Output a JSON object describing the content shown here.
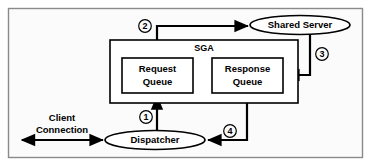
{
  "diagram": {
    "background_color": "#ffffff",
    "frame_color": "#8a8a8a",
    "line_color": "#000000",
    "shape_fill": "#ffffff",
    "nodes": {
      "shared_server": {
        "label": "Shared Server",
        "shape": "ellipse"
      },
      "dispatcher": {
        "label": "Dispatcher",
        "shape": "ellipse"
      },
      "sga": {
        "label": "SGA",
        "shape": "rectangle"
      },
      "request_queue": {
        "label_line1": "Request",
        "label_line2": "Queue",
        "shape": "rectangle"
      },
      "response_queue": {
        "label_line1": "Response",
        "label_line2": "Queue",
        "shape": "rectangle"
      },
      "client_connection": {
        "label_line1": "Client",
        "label_line2": "Connection",
        "shape": "text"
      }
    },
    "step_markers": [
      {
        "id": "step-1",
        "number": "1",
        "description": "Dispatcher to Request Queue"
      },
      {
        "id": "step-2",
        "number": "2",
        "description": "Request Queue to Shared Server"
      },
      {
        "id": "step-3",
        "number": "3",
        "description": "Shared Server to Response Queue"
      },
      {
        "id": "step-4",
        "number": "4",
        "description": "Response Queue to Dispatcher"
      }
    ],
    "connections": [
      {
        "from": "dispatcher",
        "to": "request_queue",
        "marker": "1",
        "arrow": "single"
      },
      {
        "from": "request_queue",
        "to": "shared_server",
        "marker": "2",
        "arrow": "single"
      },
      {
        "from": "shared_server",
        "to": "response_queue",
        "marker": "3",
        "arrow": "single"
      },
      {
        "from": "response_queue",
        "to": "dispatcher",
        "marker": "4",
        "arrow": "single"
      },
      {
        "from": "client",
        "to": "dispatcher",
        "marker": "",
        "arrow": "double"
      }
    ]
  }
}
